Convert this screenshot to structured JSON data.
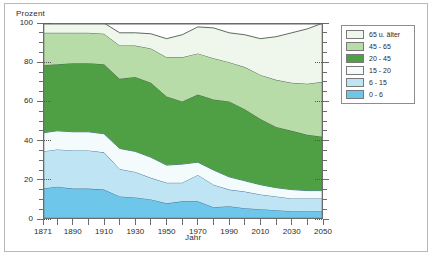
{
  "figure": {
    "y_axis_title": "Prozent",
    "x_axis_title": "Jahr"
  },
  "legend": {
    "entries": [
      {
        "label": "65 u. älter",
        "color": "#eff7ec"
      },
      {
        "label": "45 - 65",
        "color": "#b8dca8"
      },
      {
        "label": "20 - 45",
        "color": "#4f9f45"
      },
      {
        "label": "15 - 20",
        "color": "#f4fbfd"
      },
      {
        "label": "6 - 15",
        "color": "#bfe5f5"
      },
      {
        "label": "0 - 6",
        "color": "#6ec6ea"
      }
    ]
  },
  "chart_data": {
    "type": "area",
    "title": "",
    "xlabel": "Jahr",
    "ylabel": "Prozent",
    "xlim": [
      1871,
      2050
    ],
    "ylim": [
      0,
      100
    ],
    "grid": false,
    "legend_position": "right",
    "stacked": true,
    "x": [
      1871,
      1880,
      1890,
      1900,
      1910,
      1920,
      1930,
      1940,
      1950,
      1960,
      1970,
      1980,
      1990,
      2000,
      2010,
      2020,
      2030,
      2040,
      2050
    ],
    "xticks": [
      1871,
      1890,
      1910,
      1930,
      1950,
      1970,
      1990,
      2010,
      2030,
      2050
    ],
    "yticks": [
      0,
      20,
      40,
      60,
      80,
      100
    ],
    "series": [
      {
        "name": "0 - 6",
        "color": "#6ec6ea",
        "values": [
          15.5,
          16.5,
          15.5,
          15.5,
          15.0,
          11.5,
          11.0,
          10.0,
          8.0,
          9.0,
          9.0,
          6.0,
          6.5,
          5.5,
          5.0,
          4.5,
          4.0,
          4.0,
          4.0
        ]
      },
      {
        "name": "6 - 15",
        "color": "#bfe5f5",
        "values": [
          19.0,
          19.0,
          19.5,
          19.5,
          19.0,
          14.0,
          13.0,
          11.0,
          10.5,
          9.5,
          13.5,
          11.5,
          8.5,
          8.5,
          7.5,
          7.0,
          6.5,
          6.5,
          6.5
        ]
      },
      {
        "name": "15 - 20",
        "color": "#f4fbfd",
        "values": [
          9.5,
          9.5,
          9.5,
          9.5,
          9.5,
          10.5,
          10.5,
          10.5,
          9.0,
          9.5,
          6.5,
          7.5,
          6.5,
          5.5,
          5.0,
          4.5,
          4.5,
          4.0,
          4.0
        ]
      },
      {
        "name": "20 - 45",
        "color": "#4f9f45",
        "values": [
          34.5,
          34.0,
          35.0,
          35.0,
          35.5,
          35.5,
          38.0,
          38.0,
          35.0,
          32.0,
          34.5,
          36.0,
          38.5,
          36.5,
          33.5,
          31.0,
          30.0,
          28.5,
          27.5
        ]
      },
      {
        "name": "45 - 65",
        "color": "#b8dca8",
        "values": [
          16.5,
          16.0,
          15.5,
          15.5,
          15.5,
          17.0,
          16.0,
          17.5,
          20.0,
          22.5,
          21.0,
          21.0,
          20.0,
          21.5,
          22.5,
          24.0,
          24.5,
          26.0,
          28.0
        ]
      },
      {
        "name": "65 u. älter",
        "color": "#eff7ec",
        "values": [
          5.0,
          5.0,
          5.0,
          5.0,
          5.5,
          6.5,
          6.5,
          7.5,
          9.5,
          11.5,
          13.5,
          15.5,
          15.0,
          16.5,
          18.5,
          22.0,
          25.5,
          28.0,
          30.0
        ]
      }
    ]
  }
}
